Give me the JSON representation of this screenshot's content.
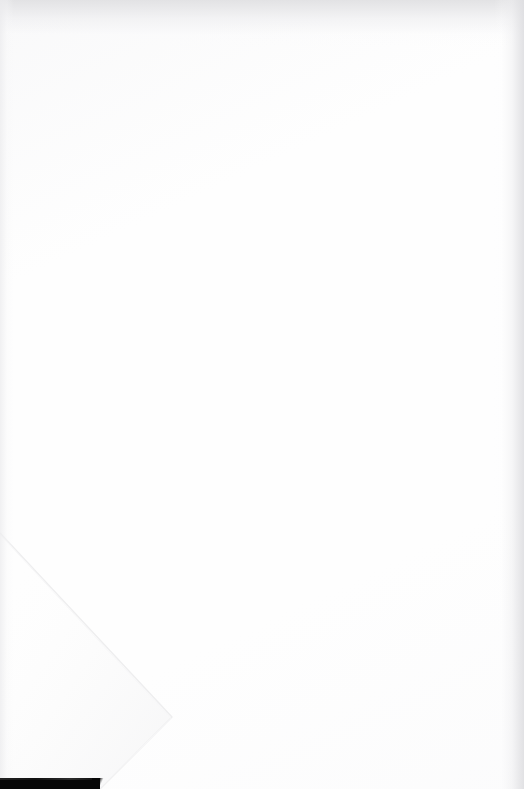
{
  "document": {
    "type": "scanned-page",
    "title": "Blank scanned page",
    "page_width": 524,
    "page_height": 789,
    "orientation": "portrait",
    "text_content": "",
    "has_visible_text": false,
    "description": "A near-blank white scanned document page with a faint diagonal fold crease in the lower-left quadrant and a solid black scanner bar along the bottom-left edge."
  },
  "colors": {
    "paper": "#fefefe",
    "page_background": "#ffffff",
    "vignette_gray": "#e1e1e3",
    "fold_line": "#efefef",
    "fold_shade": "#fafafa",
    "bar_black": "#070707",
    "bar_highlight": "#2c2c2c"
  },
  "features": {
    "fold": {
      "name": "diagonal-fold-crease",
      "shape": "v",
      "start_point": {
        "x": 0,
        "y": 533
      },
      "apex_point": {
        "x": 172,
        "y": 717
      },
      "end_point": {
        "x": 100,
        "y": 786
      },
      "stroke_color": "#efefef",
      "stroke_width": 1
    },
    "bottom_bar": {
      "name": "scanner-edge-bar",
      "x": 0,
      "y": 778,
      "width": 100,
      "height": 11,
      "color": "#070707"
    },
    "vignettes": [
      {
        "name": "top-vignette",
        "edge": "top",
        "extent": 46
      },
      {
        "name": "right-vignette",
        "edge": "right",
        "extent": 30
      },
      {
        "name": "left-vignette",
        "edge": "left",
        "extent": 14
      }
    ]
  }
}
